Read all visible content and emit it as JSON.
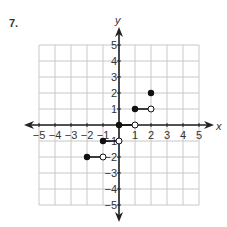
{
  "problem": {
    "number": "7."
  },
  "graph": {
    "x_axis_label": "x",
    "y_axis_label": "y",
    "x_range": [
      -5,
      5
    ],
    "y_range": [
      -5,
      5
    ],
    "x_ticks": [
      "−5",
      "−4",
      "−3",
      "−2",
      "−1",
      "1",
      "2",
      "3",
      "4",
      "5"
    ],
    "y_ticks": [
      "5",
      "4",
      "3",
      "2",
      "1",
      "−1",
      "−2",
      "−3",
      "−4",
      "−5"
    ],
    "colors": {
      "grid": "#c8c8c8",
      "axis": "#222222",
      "point": "#111111"
    }
  },
  "chart_data": {
    "type": "scatter",
    "title": "7.",
    "xlabel": "x",
    "ylabel": "y",
    "xlim": [
      -5,
      5
    ],
    "ylim": [
      -5,
      5
    ],
    "grid": true,
    "segments": [
      {
        "from": [
          -2,
          -2
        ],
        "to": [
          -1,
          -2
        ],
        "closed_start": true,
        "open_end": true
      },
      {
        "from": [
          -1,
          -1
        ],
        "to": [
          0,
          -1
        ],
        "closed_start": true,
        "open_end": true
      },
      {
        "from": [
          0,
          0
        ],
        "to": [
          1,
          0
        ],
        "closed_start": true,
        "open_end": true
      },
      {
        "from": [
          1,
          1
        ],
        "to": [
          2,
          1
        ],
        "closed_start": true,
        "open_end": true
      },
      {
        "from": [
          2,
          2
        ],
        "to": [
          2,
          2
        ],
        "closed_start": true,
        "open_end": false
      }
    ]
  }
}
